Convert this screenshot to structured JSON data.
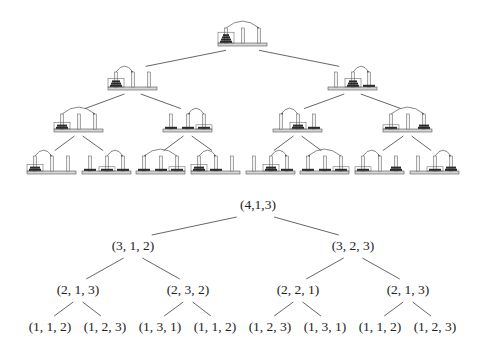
{
  "colors": {
    "line": "#555555",
    "base_fill": "#d6d6d6",
    "base_stroke": "#555555",
    "peg_fill": "#f2f2f2",
    "disk_fill": "#2b2b2b",
    "text": "#222222"
  },
  "picture_tree": {
    "levels": [
      {
        "y": 43,
        "nodes": [
          {
            "x": 218,
            "disks": [
              4,
              0,
              0
            ],
            "from": 0,
            "to": 2,
            "box": 0
          }
        ]
      },
      {
        "y": 87,
        "nodes": [
          {
            "x": 108,
            "disks": [
              3,
              0,
              0
            ],
            "from": 0,
            "to": 1,
            "box": 0
          },
          {
            "x": 328,
            "disks": [
              0,
              3,
              1
            ],
            "from": 1,
            "to": 2,
            "box": 1
          }
        ]
      },
      {
        "y": 129,
        "nodes": [
          {
            "x": 54,
            "disks": [
              2,
              0,
              0
            ],
            "from": 0,
            "to": 2,
            "box": 0
          },
          {
            "x": 163,
            "disks": [
              1,
              1,
              1
            ],
            "from": 2,
            "to": 1,
            "box": 2
          },
          {
            "x": 273,
            "disks": [
              0,
              2,
              1
            ],
            "from": 1,
            "to": 0,
            "box": 1
          },
          {
            "x": 383,
            "disks": [
              1,
              0,
              2
            ],
            "from": 0,
            "to": 2,
            "box": 0
          }
        ]
      },
      {
        "y": 171,
        "nodes": [
          {
            "x": 27,
            "disks": [
              2,
              0,
              0
            ],
            "from": 0,
            "to": 1,
            "box": 0
          },
          {
            "x": 82,
            "disks": [
              1,
              1,
              1
            ],
            "from": 1,
            "to": 2,
            "box": 1
          },
          {
            "x": 136,
            "disks": [
              1,
              1,
              1
            ],
            "from": 2,
            "to": 0,
            "box": 2
          },
          {
            "x": 191,
            "disks": [
              2,
              1,
              0
            ],
            "from": 0,
            "to": 1,
            "box": 0
          },
          {
            "x": 246,
            "disks": [
              0,
              2,
              1
            ],
            "from": 1,
            "to": 2,
            "box": 1
          },
          {
            "x": 300,
            "disks": [
              1,
              1,
              1
            ],
            "from": 2,
            "to": 0,
            "box": 2
          },
          {
            "x": 355,
            "disks": [
              1,
              0,
              2
            ],
            "from": 0,
            "to": 1,
            "box": 0
          },
          {
            "x": 410,
            "disks": [
              0,
              1,
              2
            ],
            "from": 1,
            "to": 2,
            "box": 1
          }
        ]
      }
    ]
  },
  "label_tree": {
    "levels": [
      {
        "y": 209,
        "nodes": [
          {
            "x": 258,
            "label": "(4,1,3)"
          }
        ]
      },
      {
        "y": 250,
        "nodes": [
          {
            "x": 133,
            "label": "(3, 1, 2)"
          },
          {
            "x": 353,
            "label": "(3, 2, 3)"
          }
        ]
      },
      {
        "y": 294,
        "nodes": [
          {
            "x": 78,
            "label": "(2, 1, 3)"
          },
          {
            "x": 188,
            "label": "(2, 3, 2)"
          },
          {
            "x": 298,
            "label": "(2, 2, 1)"
          },
          {
            "x": 408,
            "label": "(2, 1, 3)"
          }
        ]
      },
      {
        "y": 331,
        "nodes": [
          {
            "x": 50,
            "label": "(1, 1, 2)"
          },
          {
            "x": 105,
            "label": "(1, 2, 3)"
          },
          {
            "x": 160,
            "label": "(1, 3, 1)"
          },
          {
            "x": 215,
            "label": "(1, 1, 2)"
          },
          {
            "x": 270,
            "label": "(1, 2, 3)"
          },
          {
            "x": 325,
            "label": "(1, 3, 1)"
          },
          {
            "x": 380,
            "label": "(1, 1, 2)"
          },
          {
            "x": 435,
            "label": "(1, 2, 3)"
          }
        ]
      }
    ]
  }
}
